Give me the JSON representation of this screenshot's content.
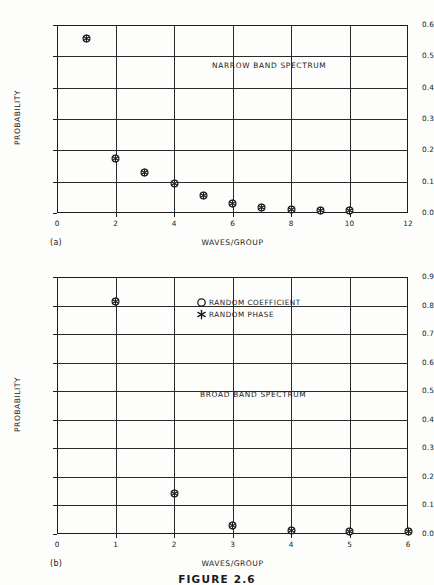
{
  "figure": {
    "caption": "FIGURE 2.6",
    "ylabel": "PROBABILITY",
    "xlabel": "WAVES/GROUP"
  },
  "legend": {
    "position": "inside-upper-right-panel-b",
    "entries": [
      {
        "glyph": "open-circle",
        "label": "RANDOM COEFFICIENT"
      },
      {
        "glyph": "asterisk",
        "label": "RANDOM PHASE"
      }
    ]
  },
  "panels": [
    {
      "tag": "(a)",
      "annotation": "NARROW BAND SPECTRUM",
      "yticks": [
        "0.0",
        "0.1",
        "0.2",
        "0.3",
        "0.4",
        "0.5",
        "0.6"
      ],
      "xticks": [
        "0",
        "2",
        "4",
        "6",
        "8",
        "10",
        "12"
      ]
    },
    {
      "tag": "(b)",
      "annotation": "BROAD BAND SPECTRUM",
      "yticks": [
        "0.0",
        "0.1",
        "0.2",
        "0.3",
        "0.4",
        "0.5",
        "0.6",
        "0.7",
        "0.8",
        "0.9"
      ],
      "xticks": [
        "0",
        "1",
        "2",
        "3",
        "4",
        "5",
        "6"
      ]
    }
  ],
  "chart_data": [
    {
      "type": "scatter",
      "title": "NARROW BAND SPECTRUM",
      "panel": "(a)",
      "xlabel": "WAVES/GROUP",
      "ylabel": "PROBABILITY",
      "xlim": [
        0,
        12
      ],
      "ylim": [
        0.0,
        0.6
      ],
      "xticks": [
        0,
        2,
        4,
        6,
        8,
        10,
        12
      ],
      "yticks": [
        0.0,
        0.1,
        0.2,
        0.3,
        0.4,
        0.5,
        0.6
      ],
      "grid": true,
      "x": [
        1,
        2,
        3,
        4,
        5,
        6,
        7,
        8,
        9,
        10
      ],
      "series": [
        {
          "name": "RANDOM COEFFICIENT",
          "glyph": "open-circle",
          "values": [
            0.556,
            0.176,
            0.131,
            0.096,
            0.055,
            0.034,
            0.018,
            0.011,
            0.01,
            0.01
          ]
        },
        {
          "name": "RANDOM PHASE",
          "glyph": "asterisk",
          "values": [
            0.555,
            0.172,
            0.13,
            0.092,
            0.054,
            0.03,
            0.017,
            0.01,
            0.009,
            0.009
          ]
        }
      ]
    },
    {
      "type": "scatter",
      "title": "BROAD BAND SPECTRUM",
      "panel": "(b)",
      "xlabel": "WAVES/GROUP",
      "ylabel": "PROBABILITY",
      "xlim": [
        0,
        6
      ],
      "ylim": [
        0.0,
        0.9
      ],
      "xticks": [
        0,
        1,
        2,
        3,
        4,
        5,
        6
      ],
      "yticks": [
        0.0,
        0.1,
        0.2,
        0.3,
        0.4,
        0.5,
        0.6,
        0.7,
        0.8,
        0.9
      ],
      "grid": true,
      "x": [
        1,
        2,
        3,
        4,
        5,
        6
      ],
      "series": [
        {
          "name": "RANDOM COEFFICIENT",
          "glyph": "open-circle",
          "values": [
            0.814,
            0.142,
            0.031,
            0.013,
            0.011,
            0.009
          ]
        },
        {
          "name": "RANDOM PHASE",
          "glyph": "asterisk",
          "values": [
            0.812,
            0.139,
            0.029,
            0.012,
            0.01,
            0.008
          ]
        }
      ]
    }
  ]
}
